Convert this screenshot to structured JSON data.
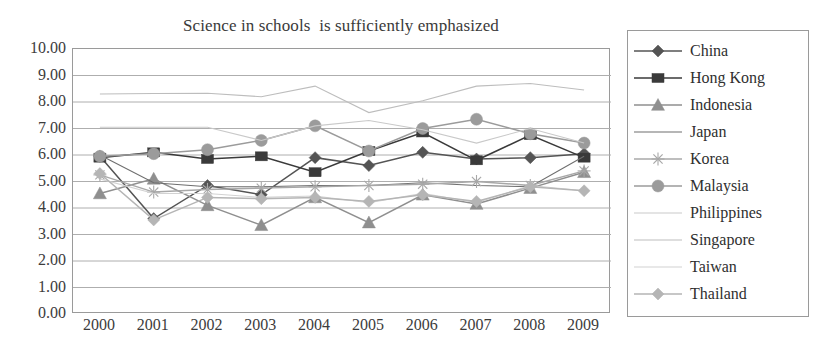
{
  "chart_data": {
    "type": "line",
    "title": "Science in schools  is sufficiently emphasized",
    "xlabel": "",
    "ylabel": "",
    "x": [
      "2000",
      "2001",
      "2002",
      "2003",
      "2004",
      "2005",
      "2006",
      "2007",
      "2008",
      "2009"
    ],
    "categories": [
      "2000",
      "2001",
      "2002",
      "2003",
      "2004",
      "2005",
      "2006",
      "2007",
      "2008",
      "2009"
    ],
    "ylim": [
      0,
      10
    ],
    "ytick_labels": [
      "10.00",
      "9.00",
      "8.00",
      "7.00",
      "6.00",
      "5.00",
      "4.00",
      "3.00",
      "2.00",
      "1.00",
      "0.00"
    ],
    "ytick_values": [
      10,
      9,
      8,
      7,
      6,
      5,
      4,
      3,
      2,
      1,
      0
    ],
    "ystep": 1,
    "grid": true,
    "legend_position": "right",
    "series": [
      {
        "name": "China",
        "marker": "diamond",
        "color": "#545454",
        "values": [
          5.95,
          3.6,
          4.85,
          4.5,
          5.9,
          5.6,
          6.1,
          5.85,
          5.9,
          6.05
        ]
      },
      {
        "name": "Hong Kong",
        "marker": "square",
        "color": "#3a3a3a",
        "values": [
          5.9,
          6.1,
          5.85,
          5.95,
          5.35,
          6.15,
          6.85,
          5.8,
          6.75,
          5.9
        ]
      },
      {
        "name": "Indonesia",
        "marker": "triangle",
        "color": "#8f8f8f",
        "values": [
          4.55,
          5.1,
          4.1,
          3.35,
          4.4,
          3.45,
          4.5,
          4.15,
          4.75,
          5.35
        ]
      },
      {
        "name": "Japan",
        "marker": "none",
        "color": "#6e6e6e",
        "values": [
          6.0,
          4.95,
          4.8,
          4.8,
          4.85,
          4.85,
          4.95,
          4.85,
          4.8,
          5.95
        ]
      },
      {
        "name": "Korea",
        "marker": "star",
        "color": "#a8a8a8",
        "values": [
          5.25,
          4.6,
          4.7,
          4.75,
          4.8,
          4.85,
          4.9,
          5.0,
          4.85,
          5.4
        ]
      },
      {
        "name": "Malaysia",
        "marker": "circle",
        "color": "#9b9b9b",
        "values": [
          5.95,
          6.05,
          6.2,
          6.55,
          7.1,
          6.15,
          7.0,
          7.35,
          6.8,
          6.45
        ]
      },
      {
        "name": "Philippines",
        "marker": "none",
        "color": "#c9c9c9",
        "values": [
          7.05,
          7.05,
          7.05,
          6.55,
          7.1,
          7.3,
          6.95,
          6.45,
          7.0,
          6.45
        ]
      },
      {
        "name": "Singapore",
        "marker": "none",
        "color": "#bdbdbd",
        "values": [
          8.3,
          8.32,
          8.33,
          8.2,
          8.6,
          7.6,
          8.05,
          8.6,
          8.7,
          8.45
        ]
      },
      {
        "name": "Taiwan",
        "marker": "none",
        "color": "#d2d2d2",
        "values": [
          5.1,
          4.55,
          4.55,
          4.4,
          4.45,
          4.2,
          4.55,
          4.2,
          4.85,
          4.65
        ]
      },
      {
        "name": "Thailand",
        "marker": "diamond-light",
        "color": "#b5b5b5",
        "values": [
          5.3,
          3.55,
          4.4,
          4.35,
          4.4,
          4.25,
          4.5,
          4.25,
          4.8,
          4.65
        ]
      }
    ]
  },
  "legend": {
    "items": [
      {
        "label": "China"
      },
      {
        "label": "Hong Kong"
      },
      {
        "label": "Indonesia"
      },
      {
        "label": "Japan"
      },
      {
        "label": "Korea"
      },
      {
        "label": "Malaysia"
      },
      {
        "label": "Philippines"
      },
      {
        "label": "Singapore"
      },
      {
        "label": "Taiwan"
      },
      {
        "label": "Thailand"
      }
    ]
  }
}
